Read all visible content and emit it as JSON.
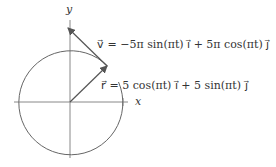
{
  "diagram": {
    "axes": {
      "x_label": "x",
      "y_label": "y"
    },
    "circle": {
      "radius_label": "5"
    },
    "velocity_equation": "v⃗ = −5π sin(πt) i⃗ + 5π cos(πt) j⃗",
    "position_equation": "r⃗ = 5 cos(πt) i⃗ + 5 sin(πt) j⃗",
    "colors": {
      "stroke": "#555555",
      "text": "#333333"
    }
  }
}
